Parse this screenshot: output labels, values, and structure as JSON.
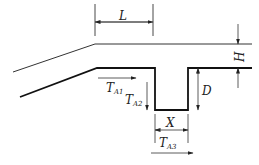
{
  "diagram": {
    "type": "cross-section schematic",
    "colors": {
      "line": "#222222",
      "background": "#ffffff"
    },
    "labels": {
      "L": "L",
      "H": "H",
      "D": "D",
      "X": "X",
      "TA1": {
        "main": "T",
        "sub": "A1"
      },
      "TA2": {
        "main": "T",
        "sub": "A2"
      },
      "TA3": {
        "main": "T",
        "sub": "A3"
      }
    }
  }
}
